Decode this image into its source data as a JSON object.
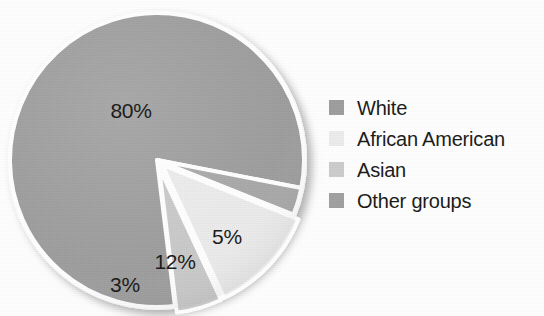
{
  "chart_data": {
    "type": "pie",
    "title": "",
    "subtitle": "",
    "xlabel": "",
    "ylabel": "",
    "categories": [
      "White",
      "African American",
      "Asian",
      "Other groups"
    ],
    "values": [
      80,
      12,
      5,
      3
    ],
    "value_labels": [
      "80%",
      "12%",
      "5%",
      "3%"
    ],
    "colors": [
      "#9d9d9d",
      "#ebebeb",
      "#c9c9c9",
      "#a8a8a8"
    ],
    "legend_position": "right",
    "grid": false,
    "annotations": []
  },
  "pie": {
    "slices": [
      {
        "name": "White",
        "label": "80%",
        "value": 80,
        "color": "#9d9d9d",
        "label_x": 131,
        "label_y": 111
      },
      {
        "name": "Asian",
        "label": "5%",
        "value": 5,
        "color": "#c9c9c9",
        "label_x": 227,
        "label_y": 237
      },
      {
        "name": "African American",
        "label": "12%",
        "value": 12,
        "color": "#ebebeb",
        "label_x": 175,
        "label_y": 262
      },
      {
        "name": "Other groups",
        "label": "3%",
        "value": 3,
        "color": "#a8a8a8",
        "label_x": 125,
        "label_y": 285
      }
    ]
  },
  "legend": {
    "items": [
      {
        "label": "White",
        "color": "#9d9d9d"
      },
      {
        "label": "African American",
        "color": "#ececec"
      },
      {
        "label": "Asian",
        "color": "#cccccc"
      },
      {
        "label": "Other groups",
        "color": "#a0a0a0"
      }
    ]
  }
}
